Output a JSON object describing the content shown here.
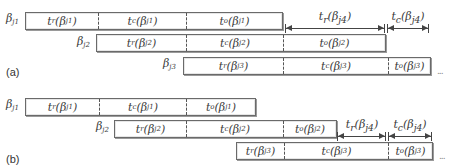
{
  "figure": {
    "panels": [
      {
        "tag": "(a)",
        "rows": [
          {
            "label": "β",
            "label_sub": "j1",
            "segments": [
              {
                "t": "t",
                "t_sub": "r",
                "arg": "(β",
                "arg_sub": "j1",
                "close": ")"
              },
              {
                "t": "t",
                "t_sub": "c",
                "arg": "(β",
                "arg_sub": "j1",
                "close": ")"
              },
              {
                "t": "t",
                "t_sub": "o",
                "arg": "(β",
                "arg_sub": "j1",
                "close": ")"
              }
            ]
          },
          {
            "label": "β",
            "label_sub": "j2",
            "segments": [
              {
                "t": "t",
                "t_sub": "r",
                "arg": "(β",
                "arg_sub": "j2",
                "close": ")"
              },
              {
                "t": "t",
                "t_sub": "c",
                "arg": "(β",
                "arg_sub": "j2",
                "close": ")"
              },
              {
                "t": "t",
                "t_sub": "o",
                "arg": "(β",
                "arg_sub": "j2",
                "close": ")"
              }
            ]
          },
          {
            "label": "β",
            "label_sub": "j3",
            "segments": [
              {
                "t": "t",
                "t_sub": "r",
                "arg": "(β",
                "arg_sub": "j3",
                "close": ")"
              },
              {
                "t": "t",
                "t_sub": "c",
                "arg": "(β",
                "arg_sub": "j3",
                "close": ")"
              },
              {
                "t": "t",
                "t_sub": "o",
                "arg": "(β",
                "arg_sub": "j3",
                "close": ")"
              }
            ]
          }
        ],
        "arrows": [
          {
            "t": "t",
            "t_sub": "r",
            "arg": "(β",
            "arg_sub": "j4",
            "close": ")"
          },
          {
            "t": "t",
            "t_sub": "c",
            "arg": "(β",
            "arg_sub": "j4",
            "close": ")"
          }
        ],
        "ellipsis": "..."
      },
      {
        "tag": "(b)",
        "rows": [
          {
            "label": "β",
            "label_sub": "j1",
            "segments": [
              {
                "t": "t",
                "t_sub": "r",
                "arg": "(β",
                "arg_sub": "j1",
                "close": ")"
              },
              {
                "t": "t",
                "t_sub": "c",
                "arg": "(β",
                "arg_sub": "j1",
                "close": ")"
              },
              {
                "t": "t",
                "t_sub": "o",
                "arg": "(β",
                "arg_sub": "j1",
                "close": ")"
              }
            ]
          },
          {
            "label": "β",
            "label_sub": "j2",
            "segments": [
              {
                "t": "t",
                "t_sub": "r",
                "arg": "(β",
                "arg_sub": "j2",
                "close": ")"
              },
              {
                "t": "t",
                "t_sub": "c",
                "arg": "(β",
                "arg_sub": "j2",
                "close": ")"
              },
              {
                "t": "t",
                "t_sub": "o",
                "arg": "(β",
                "arg_sub": "j2",
                "close": ")"
              }
            ]
          },
          {
            "segments": [
              {
                "t": "t",
                "t_sub": "r",
                "arg": "(β",
                "arg_sub": "j3",
                "close": ")"
              },
              {
                "t": "t",
                "t_sub": "c",
                "arg": "(β",
                "arg_sub": "j3",
                "close": ")"
              },
              {
                "t": "t",
                "t_sub": "o",
                "arg": "(β",
                "arg_sub": "j3",
                "close": ")"
              }
            ]
          }
        ],
        "arrows": [
          {
            "t": "t",
            "t_sub": "r",
            "arg": "(β",
            "arg_sub": "j4",
            "close": ")"
          },
          {
            "t": "t",
            "t_sub": "c",
            "arg": "(β",
            "arg_sub": "j4",
            "close": ")"
          }
        ],
        "ellipsis": "..."
      }
    ]
  }
}
